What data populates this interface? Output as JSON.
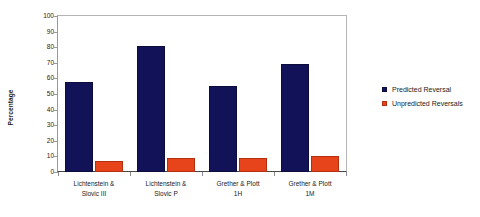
{
  "chart_data": {
    "type": "bar",
    "title": "",
    "xlabel": "",
    "ylabel": "Percentage",
    "ylim": [
      0,
      100
    ],
    "ytick_step": 10,
    "yticks": [
      100,
      90,
      80,
      70,
      60,
      50,
      40,
      30,
      20,
      10,
      0
    ],
    "grid": false,
    "legend_position": "right",
    "categories": [
      "Lichtenstein & Slovic III",
      "Lichtenstein & Slovic P",
      "Grether & Plott 1H",
      "Grether & Plott 1M"
    ],
    "category_lines": [
      [
        "Lichtenstein &",
        "Slovic III"
      ],
      [
        "Lichtenstein &",
        "Slovic P"
      ],
      [
        "Grether & Plott",
        "1H"
      ],
      [
        "Grether & Plott",
        "1M"
      ]
    ],
    "series": [
      {
        "name": "Predicted Reversal",
        "color": "#121258",
        "values": [
          58,
          81,
          55,
          69
        ]
      },
      {
        "name": "Unpredicted Reversals",
        "color": "#e8441b",
        "values": [
          7,
          9,
          9,
          10
        ]
      }
    ]
  },
  "legend": {
    "items": [
      {
        "label": "Predicted Reversal",
        "swatch": "predicted"
      },
      {
        "label": "Unpredicted Reversals",
        "swatch": "unpredicted"
      }
    ]
  },
  "axis": {
    "y_title": "Percentage"
  }
}
